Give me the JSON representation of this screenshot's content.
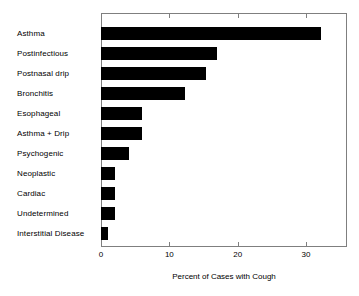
{
  "chart_data": {
    "type": "bar",
    "orientation": "horizontal",
    "title": "",
    "xlabel": "Percent of Cases with Cough",
    "ylabel": "",
    "xlim": [
      0,
      36
    ],
    "xticks": [
      0,
      10,
      20,
      30
    ],
    "xtick_labels": [
      "0",
      "10",
      "20",
      "30"
    ],
    "grid": false,
    "legend": null,
    "bar_color": "#000000",
    "frame_color": "#7f7f7f",
    "categories": [
      "Asthma",
      "Postinfectious",
      "Postnasal drip",
      "Bronchitis",
      "Esophageal",
      "Asthma + Drip",
      "Psychogenic",
      "Neoplastic",
      "Cardiac",
      "Undetermined",
      "Interstitial Disease"
    ],
    "values": [
      32.2,
      17.0,
      15.4,
      12.3,
      6.0,
      6.0,
      4.1,
      2.0,
      2.0,
      2.0,
      1.0
    ]
  }
}
